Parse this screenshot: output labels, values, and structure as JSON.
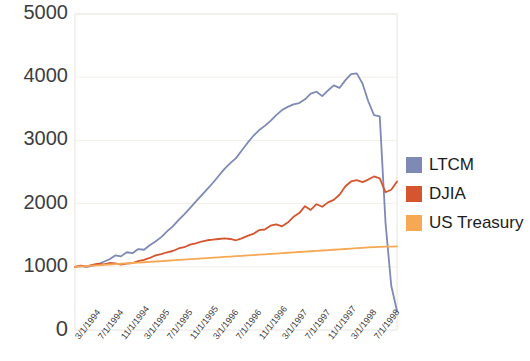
{
  "chart_data": {
    "type": "line",
    "title": "",
    "xlabel": "",
    "ylabel": "",
    "ylim": [
      0,
      5000
    ],
    "ytick_labels": [
      "0",
      "1000",
      "2000",
      "3000",
      "4000",
      "5000"
    ],
    "ytick_values": [
      0,
      1000,
      2000,
      3000,
      4000,
      5000
    ],
    "grid": true,
    "grid_axis": "y",
    "legend_position": "right",
    "x_tick_labels": [
      "3/1/1994",
      "7/1/1994",
      "11/1/1994",
      "3/1/1995",
      "7/1/1995",
      "11/1/1995",
      "3/1/1996",
      "7/1/1996",
      "11/1/1996",
      "3/1/1997",
      "7/1/1997",
      "11/1/1997",
      "3/1/1998",
      "7/1/1998"
    ],
    "x": [
      "3/1/1994",
      "4/1/1994",
      "5/1/1994",
      "6/1/1994",
      "7/1/1994",
      "8/1/1994",
      "9/1/1994",
      "10/1/1994",
      "11/1/1994",
      "12/1/1994",
      "1/1/1995",
      "2/1/1995",
      "3/1/1995",
      "4/1/1995",
      "5/1/1995",
      "6/1/1995",
      "7/1/1995",
      "8/1/1995",
      "9/1/1995",
      "10/1/1995",
      "11/1/1995",
      "12/1/1995",
      "1/1/1996",
      "2/1/1996",
      "3/1/1996",
      "4/1/1996",
      "5/1/1996",
      "6/1/1996",
      "7/1/1996",
      "8/1/1996",
      "9/1/1996",
      "10/1/1996",
      "11/1/1996",
      "12/1/1996",
      "1/1/1997",
      "2/1/1997",
      "3/1/1997",
      "4/1/1997",
      "5/1/1997",
      "6/1/1997",
      "7/1/1997",
      "8/1/1997",
      "9/1/1997",
      "10/1/1997",
      "11/1/1997",
      "12/1/1997",
      "1/1/1998",
      "2/1/1998",
      "3/1/1998",
      "4/1/1998",
      "5/1/1998",
      "6/1/1998",
      "7/1/1998",
      "8/1/1998",
      "9/1/1998",
      "10/1/1998",
      "11/1/1998"
    ],
    "series": [
      {
        "name": "LTCM",
        "color": "#7e8ab5",
        "values": [
          1000,
          1010,
          1000,
          1015,
          1040,
          1080,
          1120,
          1180,
          1165,
          1230,
          1215,
          1280,
          1270,
          1340,
          1400,
          1470,
          1560,
          1640,
          1740,
          1830,
          1930,
          2030,
          2130,
          2230,
          2330,
          2440,
          2550,
          2640,
          2720,
          2840,
          2960,
          3070,
          3160,
          3230,
          3310,
          3400,
          3480,
          3530,
          3570,
          3590,
          3650,
          3740,
          3770,
          3700,
          3790,
          3870,
          3830,
          3950,
          4050,
          4060,
          3900,
          3620,
          3400,
          3380,
          1700,
          700,
          300
        ]
      },
      {
        "name": "DJIA",
        "color": "#d4552e",
        "values": [
          1000,
          1020,
          1005,
          1030,
          1050,
          1040,
          1060,
          1055,
          1035,
          1050,
          1060,
          1090,
          1110,
          1140,
          1180,
          1200,
          1230,
          1250,
          1290,
          1310,
          1350,
          1370,
          1400,
          1420,
          1430,
          1440,
          1450,
          1440,
          1420,
          1450,
          1490,
          1520,
          1580,
          1590,
          1650,
          1670,
          1640,
          1700,
          1790,
          1850,
          1960,
          1900,
          1990,
          1950,
          2020,
          2060,
          2140,
          2270,
          2350,
          2370,
          2340,
          2380,
          2430,
          2400,
          2180,
          2220,
          2350
        ]
      },
      {
        "name": "US Treasury",
        "color": "#f6a855",
        "values": [
          1000,
          1006,
          1012,
          1018,
          1024,
          1030,
          1036,
          1042,
          1048,
          1054,
          1060,
          1066,
          1072,
          1078,
          1084,
          1090,
          1096,
          1102,
          1108,
          1114,
          1120,
          1126,
          1132,
          1138,
          1144,
          1150,
          1156,
          1162,
          1168,
          1174,
          1180,
          1186,
          1192,
          1198,
          1204,
          1210,
          1216,
          1222,
          1228,
          1234,
          1240,
          1246,
          1252,
          1258,
          1264,
          1270,
          1276,
          1282,
          1288,
          1294,
          1300,
          1306,
          1310,
          1314,
          1318,
          1320,
          1322
        ]
      }
    ]
  },
  "legend": {
    "items": [
      {
        "label": "LTCM",
        "color": "#7e8ab5"
      },
      {
        "label": "DJIA",
        "color": "#d4552e"
      },
      {
        "label": "US Treasury",
        "color": "#f6a855"
      }
    ]
  }
}
